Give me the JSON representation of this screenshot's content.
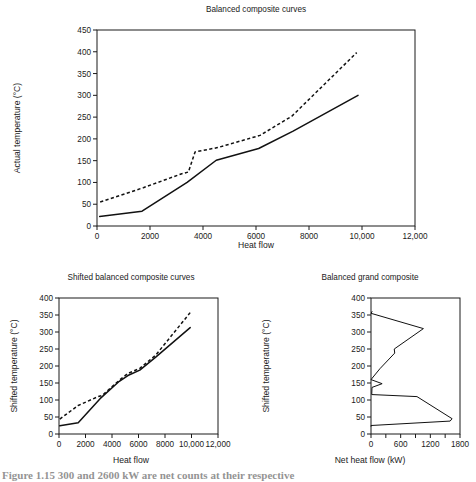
{
  "figure": {
    "caption": "Figure 1.15  300 and 2600 kW are net counts at their respective",
    "background": "#ffffff",
    "line_color": "#111111"
  },
  "chart_data": [
    {
      "id": "balanced-composite-curves",
      "type": "line",
      "title": "Balanced composite curves",
      "xlabel": "Heat flow",
      "ylabel": "Actual temperature (°C)",
      "xlim": [
        0,
        12000
      ],
      "ylim": [
        0,
        450
      ],
      "xticks": [
        0,
        2000,
        4000,
        6000,
        8000,
        10000,
        12000
      ],
      "xticklabels": [
        "0",
        "2000",
        "4000",
        "6000",
        "8000",
        "10,000",
        "12,000"
      ],
      "yticks": [
        0,
        50,
        100,
        150,
        200,
        250,
        300,
        350,
        400,
        450
      ],
      "yticklabels": [
        "0",
        "50",
        "100",
        "150",
        "200",
        "250",
        "300",
        "350",
        "400",
        "450"
      ],
      "grid": false,
      "legend": "none",
      "series": [
        {
          "name": "cold composite curve",
          "style": "solid",
          "x": [
            100,
            1700,
            3400,
            4500,
            6100,
            7400,
            9850
          ],
          "y": [
            22,
            34,
            100,
            151,
            178,
            218,
            300
          ]
        },
        {
          "name": "hot composite curve",
          "style": "dashed",
          "x": [
            120,
            1750,
            3200,
            3450,
            3700,
            4550,
            6150,
            7350,
            9800
          ],
          "y": [
            55,
            88,
            120,
            124,
            170,
            180,
            208,
            252,
            398
          ]
        }
      ]
    },
    {
      "id": "shifted-balanced-composite-curves",
      "type": "line",
      "title": "Shifted balanced composite curves",
      "xlabel": "Heat flow",
      "ylabel": "Shifted temperature (°C)",
      "xlim": [
        0,
        12000
      ],
      "ylim": [
        0,
        400
      ],
      "xticks": [
        0,
        2000,
        4000,
        6000,
        8000,
        10000,
        12000
      ],
      "xticklabels": [
        "0",
        "2000",
        "4000",
        "6000",
        "8000",
        "10,000",
        "12,000"
      ],
      "yticks": [
        0,
        50,
        100,
        150,
        200,
        250,
        300,
        350,
        400
      ],
      "yticklabels": [
        "0",
        "50",
        "100",
        "150",
        "200",
        "250",
        "300",
        "350",
        "400"
      ],
      "grid": false,
      "legend": "none",
      "series": [
        {
          "name": "shifted cold composite curve",
          "style": "solid",
          "x": [
            60,
            1450,
            3100,
            4550,
            5200,
            6100,
            7300,
            9900
          ],
          "y": [
            24,
            33,
            104,
            155,
            172,
            188,
            226,
            313
          ]
        },
        {
          "name": "shifted hot composite curve",
          "style": "dashed",
          "x": [
            60,
            1450,
            2950,
            3250,
            4550,
            5200,
            6100,
            7300,
            9900
          ],
          "y": [
            44,
            84,
            110,
            113,
            158,
            178,
            193,
            232,
            357
          ]
        }
      ]
    },
    {
      "id": "balanced-grand-composite",
      "type": "line",
      "title": "Balanced grand composite",
      "xlabel": "Net heat flow (kW)",
      "ylabel": "Shifted temperature (°C)",
      "xlim": [
        0,
        1800
      ],
      "ylim": [
        0,
        400
      ],
      "xticks": [
        0,
        300,
        600,
        900,
        1200,
        1500,
        1800
      ],
      "xticklabels": [
        "0",
        "",
        "600",
        "",
        "1200",
        "",
        "1800"
      ],
      "yticks": [
        0,
        50,
        100,
        150,
        200,
        250,
        300,
        350,
        400
      ],
      "yticklabels": [
        "0",
        "50",
        "100",
        "150",
        "200",
        "250",
        "300",
        "350",
        "400"
      ],
      "grid": false,
      "legend": "none",
      "series": [
        {
          "name": "balanced grand composite curve",
          "style": "solid",
          "orientation": "vertical",
          "x": [
            20,
            0,
            1060,
            470,
            480,
            180,
            0,
            225,
            20,
            15,
            930,
            1640,
            1600,
            0,
            0
          ],
          "y": [
            360,
            355,
            310,
            250,
            238,
            192,
            160,
            148,
            137,
            116,
            110,
            45,
            38,
            25,
            23
          ]
        }
      ]
    }
  ]
}
